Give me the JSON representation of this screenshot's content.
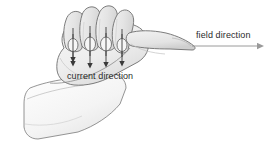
{
  "figure": {
    "background_color": "#ffffff",
    "width": 271,
    "height": 144
  },
  "labels": {
    "current": "current direction",
    "field": "field direction"
  },
  "colors": {
    "outline": "#6e6e6e",
    "outline_dark": "#4a4a4a",
    "hand_fill": "#ececec",
    "finger_fill": "#e4e4e4",
    "palm_fill": "#f2f2f2",
    "arm_fill": "#fafafa",
    "shade": "#d2d2d2",
    "arrow_dark": "#3a3a3a",
    "arrow_gray": "#9a9a9a",
    "text": "#2b2b2b"
  },
  "arrows": {
    "current_arrows_count": 4,
    "current_arrow_direction": "down",
    "field_arrow_direction": "right",
    "field_arrow": {
      "x1": 196,
      "y1": 45,
      "x2": 262,
      "y2": 45
    },
    "current_arrow_positions": [
      {
        "x": 73,
        "y_top": 28,
        "y_bottom": 62
      },
      {
        "x": 89,
        "y_top": 26,
        "y_bottom": 64
      },
      {
        "x": 105,
        "y_top": 27,
        "y_bottom": 63
      },
      {
        "x": 121,
        "y_top": 29,
        "y_bottom": 62
      }
    ]
  },
  "label_positions": {
    "current": {
      "x": 67,
      "y": 79
    },
    "field": {
      "x": 196,
      "y": 38
    }
  }
}
